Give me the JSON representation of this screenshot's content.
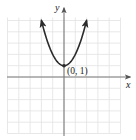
{
  "chart_data": {
    "type": "line",
    "title": "",
    "equation": "y = x^2 + 1",
    "xlabel": "x",
    "ylabel": "y",
    "xlim": [
      -5,
      5
    ],
    "ylim": [
      -5,
      5
    ],
    "grid": true,
    "series": [
      {
        "name": "parabola",
        "x": [
          -2,
          -1.5,
          -1,
          -0.5,
          0,
          0.5,
          1,
          1.5,
          2
        ],
        "y": [
          5,
          3.25,
          2,
          1.25,
          1,
          1.25,
          2,
          3.25,
          5
        ],
        "arrows_at_ends": true
      }
    ],
    "annotations": [
      {
        "text": "(0, 1)",
        "x": 0,
        "y": 1,
        "marker": "point"
      }
    ]
  },
  "labels": {
    "x_axis": "x",
    "y_axis": "y",
    "vertex": "(0, 1)"
  },
  "colors": {
    "grid": "#e2e2e2",
    "axis": "#7a7a7a",
    "curve": "#2b2b2b"
  }
}
